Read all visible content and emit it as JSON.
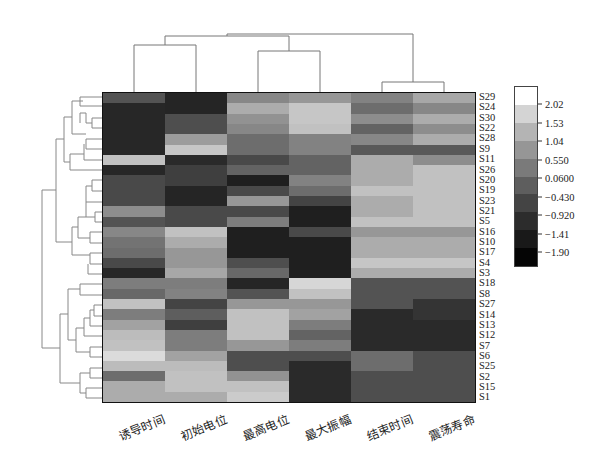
{
  "chart_data": {
    "type": "heatmap",
    "title": "",
    "xlabel": "",
    "ylabel": "",
    "columns": [
      "诱导时间",
      "初始电位",
      "最高电位",
      "最大振幅",
      "结束时间",
      "震荡寿命"
    ],
    "rows": [
      "S29",
      "S24",
      "S30",
      "S22",
      "S28",
      "S9",
      "S11",
      "S26",
      "S20",
      "S19",
      "S23",
      "S21",
      "S5",
      "S16",
      "S10",
      "S17",
      "S4",
      "S3",
      "S18",
      "S8",
      "S27",
      "S14",
      "S13",
      "S12",
      "S7",
      "S6",
      "S25",
      "S2",
      "S15",
      "S1"
    ],
    "values": [
      [
        -0.7,
        -1.6,
        0.3,
        0.6,
        0.2,
        0.9
      ],
      [
        -1.55,
        -1.6,
        1.0,
        1.5,
        -0.2,
        0.3
      ],
      [
        -1.55,
        -0.8,
        0.5,
        1.5,
        0.4,
        1.0
      ],
      [
        -1.55,
        -0.8,
        0.3,
        1.4,
        -0.4,
        0.4
      ],
      [
        -1.55,
        0.7,
        -0.2,
        0.2,
        0.3,
        1.0
      ],
      [
        -1.55,
        1.5,
        -0.2,
        0.2,
        -0.6,
        -0.6
      ],
      [
        1.4,
        -1.5,
        -0.9,
        -0.4,
        1.0,
        0.4
      ],
      [
        -1.55,
        -1.1,
        -0.4,
        -0.4,
        1.0,
        1.4
      ],
      [
        -0.9,
        -1.1,
        -1.7,
        0.2,
        1.0,
        1.4
      ],
      [
        -0.9,
        -1.6,
        -0.9,
        -0.2,
        1.4,
        1.4
      ],
      [
        -0.9,
        -1.6,
        0.6,
        -1.0,
        1.0,
        1.4
      ],
      [
        0.4,
        -0.9,
        -0.9,
        -1.7,
        1.0,
        1.4
      ],
      [
        -0.7,
        -0.9,
        0.1,
        -1.7,
        1.4,
        1.4
      ],
      [
        0.3,
        1.4,
        -1.7,
        -0.9,
        0.6,
        0.6
      ],
      [
        -0.1,
        1.0,
        -1.7,
        -1.7,
        1.0,
        1.0
      ],
      [
        -0.2,
        0.6,
        -1.7,
        -1.7,
        1.0,
        1.0
      ],
      [
        -0.9,
        0.6,
        -0.8,
        -1.7,
        1.5,
        1.5
      ],
      [
        -1.55,
        0.9,
        -0.3,
        -1.7,
        1.0,
        1.0
      ],
      [
        0.1,
        0.1,
        -1.6,
        1.8,
        -0.7,
        -0.7
      ],
      [
        -0.3,
        0.2,
        -0.7,
        1.4,
        -0.7,
        -0.7
      ],
      [
        1.4,
        -1.0,
        0.6,
        0.6,
        -0.7,
        -1.3
      ],
      [
        0.1,
        -0.5,
        1.4,
        0.8,
        -1.5,
        -1.3
      ],
      [
        0.8,
        -1.1,
        1.4,
        0.1,
        -1.5,
        -1.5
      ],
      [
        1.3,
        0.1,
        1.4,
        -0.4,
        -1.5,
        -1.5
      ],
      [
        1.4,
        0.1,
        0.6,
        0.1,
        -1.5,
        -1.5
      ],
      [
        1.9,
        0.8,
        -0.8,
        -0.8,
        -0.2,
        -0.8
      ],
      [
        1.3,
        1.3,
        -0.8,
        -1.5,
        -0.2,
        -0.8
      ],
      [
        -0.2,
        1.4,
        0.5,
        -1.5,
        -0.8,
        -0.8
      ],
      [
        1.0,
        1.4,
        1.4,
        -1.5,
        -0.8,
        -0.8
      ],
      [
        1.0,
        1.0,
        1.6,
        -1.5,
        -0.8,
        -0.8
      ]
    ],
    "colormap": "grayscale (low=black, high=white)",
    "legend": {
      "position": "right",
      "ticks": [
        "2.02",
        "1.53",
        "1.04",
        "0.550",
        "0.0600",
        "−0.430",
        "−0.920",
        "−1.41",
        "−1.90"
      ],
      "range": [
        -2.15,
        2.27
      ]
    },
    "column_dendrogram": {
      "clusters": [
        [
          "诱导时间",
          "初始电位"
        ],
        [
          "最高电位",
          "最大振幅"
        ],
        [
          "结束时间",
          "震荡寿命"
        ]
      ]
    },
    "row_dendrogram": true,
    "grid": false
  },
  "legend_band_colors": [
    "#ffffff",
    "#d4d4d4",
    "#b4b4b4",
    "#969696",
    "#7a7a7a",
    "#5e5e5e",
    "#444444",
    "#2c2c2c",
    "#191919",
    "#050505"
  ]
}
